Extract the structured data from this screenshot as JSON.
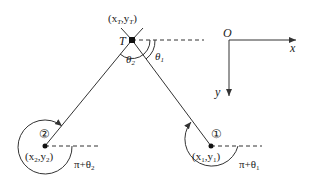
{
  "diagram": {
    "target": {
      "label": "T",
      "coord_label": "(x",
      "coord_sub1": "T",
      "coord_mid": ",y",
      "coord_sub2": "T",
      "coord_close": ")"
    },
    "angles": {
      "theta1": "θ",
      "theta1_sub": "1",
      "theta2": "θ",
      "theta2_sub": "2"
    },
    "point1": {
      "marker": "①",
      "coord_open": "(x",
      "coord_sub1": "1",
      "coord_mid": ",y",
      "coord_sub2": "1",
      "coord_close": ")",
      "angle_label": "π+θ",
      "angle_sub": "1"
    },
    "point2": {
      "marker": "②",
      "coord_open": "(x",
      "coord_sub1": "2",
      "coord_mid": ",y",
      "coord_sub2": "2",
      "coord_close": ")",
      "angle_label": "π+θ",
      "angle_sub": "2"
    },
    "axes": {
      "origin": "O",
      "x": "x",
      "y": "y"
    },
    "colors": {
      "stroke": "#333333",
      "background": "#ffffff"
    }
  }
}
